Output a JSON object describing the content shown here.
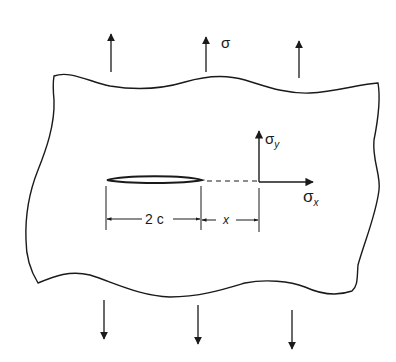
{
  "diagram": {
    "labels": {
      "remote_stress": "σ",
      "sigma_y": "σ",
      "sigma_y_sub": "y",
      "sigma_x": "σ",
      "sigma_x_sub": "x",
      "crack_length": "2 c",
      "distance": "x"
    },
    "colors": {
      "ink": "#1a1a1a",
      "background": "#ffffff"
    },
    "arrows": {
      "top_count": 3,
      "bottom_count": 3,
      "direction_top": "up",
      "direction_bottom": "down"
    }
  }
}
